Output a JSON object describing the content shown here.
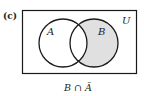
{
  "figure": {
    "part_label": "(c)",
    "universe_label": "U",
    "set_a_label": "A",
    "set_b_label": "B",
    "caption": "B ∩ Ā",
    "shaded_region": "B minus A",
    "colors": {
      "stroke": "#1a1a1a",
      "shade": "#e0e0e0",
      "background": "#ffffff"
    }
  }
}
